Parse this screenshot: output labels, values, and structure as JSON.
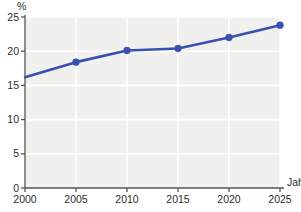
{
  "chart_data": {
    "type": "line",
    "title": "",
    "subtitle": "",
    "xlabel": "Jahr",
    "ylabel": "%",
    "x": [
      2000,
      2005,
      2010,
      2015,
      2020,
      2025
    ],
    "xtick_labels": [
      "2000",
      "2005",
      "2010",
      "2015",
      "2020",
      "2025"
    ],
    "ytick_labels": [
      "0",
      "5",
      "10",
      "15",
      "20",
      "25"
    ],
    "ytick_values": [
      0,
      5,
      10,
      15,
      20,
      25
    ],
    "values": [
      16.2,
      18.4,
      20.1,
      20.4,
      22.0,
      23.8
    ],
    "markers": [
      false,
      true,
      true,
      true,
      true,
      true
    ],
    "xlim": [
      2000,
      2025
    ],
    "ylim": [
      0,
      25
    ],
    "grid": "horizontal-and-vertical",
    "grid_color": "#ffffff",
    "plot_background": "#f0f0ee",
    "legend": "none",
    "series": [
      {
        "name": "",
        "color": "#3a50b0",
        "line_width": 2.6,
        "marker": "circle",
        "values": [
          16.2,
          18.4,
          20.1,
          20.4,
          22.0,
          23.8
        ]
      }
    ]
  },
  "axes": {
    "y_axis_label": "%",
    "x_axis_label": "Jahr",
    "axis_color": "#555555"
  }
}
